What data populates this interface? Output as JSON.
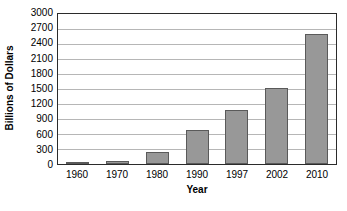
{
  "chart_data": {
    "type": "bar",
    "title": "",
    "subtitle": "",
    "xlabel": "Year",
    "ylabel": "Billions of Dollars",
    "categories": [
      "1960",
      "1970",
      "1980",
      "1990",
      "1997",
      "2002",
      "2010"
    ],
    "values": [
      30,
      70,
      240,
      690,
      1080,
      1530,
      2600
    ],
    "series": [
      {
        "name": "Billions of Dollars",
        "values": [
          30,
          70,
          240,
          690,
          1080,
          1530,
          2600
        ]
      }
    ],
    "ylim": [
      0,
      3000
    ],
    "ytick_labels": [
      "0",
      "300",
      "600",
      "900",
      "1200",
      "1500",
      "1800",
      "2100",
      "2400",
      "2700",
      "3000"
    ],
    "ytick_values": [
      0,
      300,
      600,
      900,
      1200,
      1500,
      1800,
      2100,
      2400,
      2700,
      3000
    ],
    "ytick_step": 300,
    "grid": "horizontal",
    "legend": "none",
    "colors": {
      "bar_fill": "#989898",
      "bar_border": "#5a5a5a",
      "gridline": "#b6b6b6",
      "frame": "#2b2b2b",
      "background": "#ffffff",
      "text": "#000000"
    }
  }
}
